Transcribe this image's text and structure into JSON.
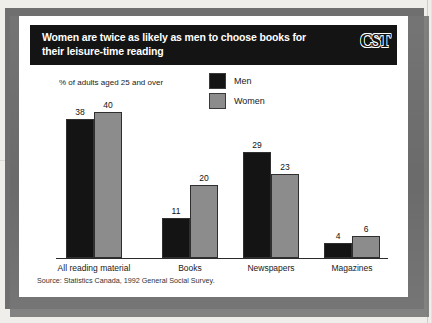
{
  "banner": {
    "title": "Women are twice as likely as men to choose books for their leisure-time reading",
    "logo": "CST"
  },
  "chart_data": {
    "type": "bar",
    "title": "Women are twice as likely as men to choose books for their leisure-time reading",
    "subtitle": "% of adults aged 25 and over",
    "xlabel": "",
    "ylabel": "% of adults aged 25 and over",
    "ylim": [
      0,
      40
    ],
    "grid": false,
    "legend_position": "top-center",
    "categories": [
      "All reading material",
      "Books",
      "Newspapers",
      "Magazines"
    ],
    "series": [
      {
        "name": "Men",
        "color": "#141414",
        "values": [
          38,
          11,
          29,
          4
        ]
      },
      {
        "name": "Women",
        "color": "#8c8c8c",
        "values": [
          40,
          20,
          23,
          6
        ]
      }
    ],
    "source": "Source: Statistics Canada, 1992 General Social Survey."
  }
}
